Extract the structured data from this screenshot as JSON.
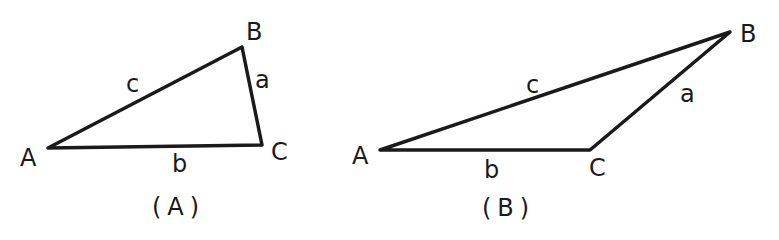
{
  "figures": [
    {
      "id": "A",
      "caption": "(A)",
      "vertices": {
        "A": {
          "label": "A",
          "x": 48,
          "y": 148
        },
        "B": {
          "label": "B",
          "x": 242,
          "y": 47
        },
        "C": {
          "label": "C",
          "x": 262,
          "y": 145
        }
      },
      "sides": {
        "a": {
          "label": "a",
          "between": [
            "B",
            "C"
          ]
        },
        "b": {
          "label": "b",
          "between": [
            "A",
            "C"
          ]
        },
        "c": {
          "label": "c",
          "between": [
            "A",
            "B"
          ]
        }
      }
    },
    {
      "id": "B",
      "caption": "(B)",
      "vertices": {
        "A": {
          "label": "A",
          "x": 380,
          "y": 150
        },
        "B": {
          "label": "B",
          "x": 730,
          "y": 32
        },
        "C": {
          "label": "C",
          "x": 590,
          "y": 150
        }
      },
      "sides": {
        "a": {
          "label": "a",
          "between": [
            "B",
            "C"
          ]
        },
        "b": {
          "label": "b",
          "between": [
            "A",
            "C"
          ]
        },
        "c": {
          "label": "c",
          "between": [
            "A",
            "B"
          ]
        }
      }
    }
  ],
  "colors": {
    "ink": "#1a1a1a",
    "background": "#ffffff"
  }
}
